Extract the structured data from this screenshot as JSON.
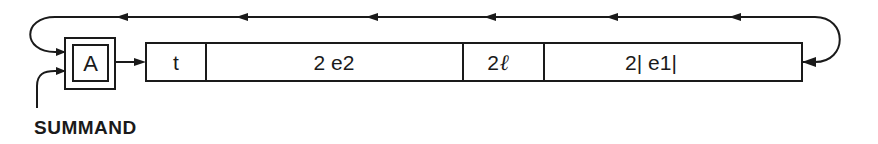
{
  "diagram": {
    "accumulator": {
      "label": "A"
    },
    "register": {
      "cells": [
        {
          "label": "t",
          "x": 146,
          "width": 60
        },
        {
          "label": "2 e2",
          "x": 206,
          "width": 257
        },
        {
          "label": "2",
          "suffix": "ℓ",
          "x": 463,
          "width": 81
        },
        {
          "label": "2| e1|",
          "x": 544,
          "width": 258
        }
      ]
    },
    "input_label": "SUMMAND",
    "feedback_arrow_positions": [
      122,
      242,
      372,
      490,
      612,
      735
    ],
    "colors": {
      "line": "#1a1a1a",
      "background": "#ffffff"
    }
  }
}
